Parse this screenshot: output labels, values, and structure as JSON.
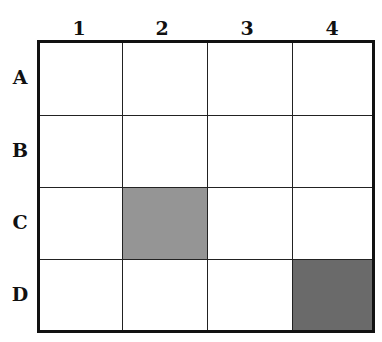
{
  "columns": [
    "1",
    "2",
    "3",
    "4"
  ],
  "rows": [
    "A",
    "B",
    "C",
    "D"
  ],
  "shaded_cells": [
    {
      "row": "C",
      "col": "2",
      "shade": "light-gray",
      "color": "#959595"
    },
    {
      "row": "D",
      "col": "4",
      "shade": "dark-gray",
      "color": "#6a6a6a"
    }
  ],
  "colors": {
    "border": "#111111",
    "empty": "#ffffff"
  }
}
